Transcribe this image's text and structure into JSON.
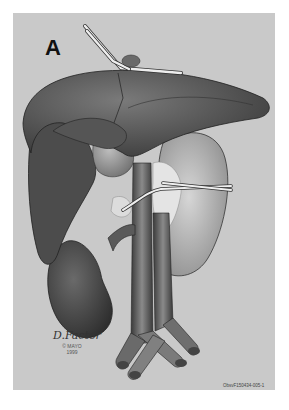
{
  "figure": {
    "panel_label": "A",
    "artist_signature": "D.Factor",
    "copyright_line1": "© MAYO",
    "copyright_line2": "1999",
    "figure_id": "ObsvF150434-005-1",
    "colors": {
      "background": "#c9c9c9",
      "organ_dark": "#4a4a4a",
      "organ_mid": "#6b6b6b",
      "organ_light": "#a8a8a8",
      "vessel": "#5a5a5a",
      "tube": "#e8e8e8"
    },
    "depicted": [
      "liver",
      "gallbladder",
      "kidney",
      "spleen",
      "aorta",
      "inferior-vena-cava",
      "iliac-vessels",
      "vessel-loops"
    ]
  }
}
